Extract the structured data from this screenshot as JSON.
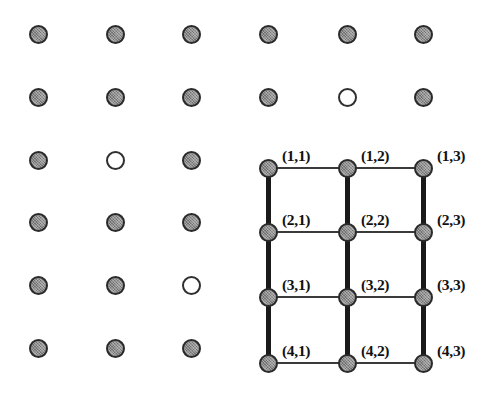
{
  "figure": {
    "width": 496,
    "height": 395,
    "background_color": "#ffffff",
    "site_colors": {
      "filled_fill": "#8e8e8e",
      "filled_border": "#2a2a2a",
      "empty_fill": "#ffffff",
      "empty_border": "#2f2f2f",
      "bond_vertical": "#1a1a1a",
      "bond_horizontal": "#3a3a3a",
      "label_color": "#111111"
    }
  },
  "lattice": {
    "columns": 6,
    "rows": 6,
    "column_x": [
      38,
      115,
      191,
      268,
      347,
      423
    ],
    "row_y": [
      34,
      97,
      160,
      222,
      285,
      348
    ],
    "site_diameter": 19,
    "sites": [
      {
        "row": 1,
        "col": 1,
        "state": "filled"
      },
      {
        "row": 1,
        "col": 2,
        "state": "filled"
      },
      {
        "row": 1,
        "col": 3,
        "state": "filled"
      },
      {
        "row": 1,
        "col": 4,
        "state": "filled"
      },
      {
        "row": 1,
        "col": 5,
        "state": "filled"
      },
      {
        "row": 1,
        "col": 6,
        "state": "filled"
      },
      {
        "row": 2,
        "col": 1,
        "state": "filled"
      },
      {
        "row": 2,
        "col": 2,
        "state": "filled"
      },
      {
        "row": 2,
        "col": 3,
        "state": "filled"
      },
      {
        "row": 2,
        "col": 4,
        "state": "filled"
      },
      {
        "row": 2,
        "col": 5,
        "state": "empty"
      },
      {
        "row": 2,
        "col": 6,
        "state": "filled"
      },
      {
        "row": 3,
        "col": 1,
        "state": "filled"
      },
      {
        "row": 3,
        "col": 2,
        "state": "empty"
      },
      {
        "row": 3,
        "col": 3,
        "state": "filled"
      },
      {
        "row": 3,
        "col": 4,
        "state": "filled"
      },
      {
        "row": 3,
        "col": 5,
        "state": "filled"
      },
      {
        "row": 3,
        "col": 6,
        "state": "filled"
      },
      {
        "row": 4,
        "col": 1,
        "state": "filled"
      },
      {
        "row": 4,
        "col": 2,
        "state": "filled"
      },
      {
        "row": 4,
        "col": 3,
        "state": "filled"
      },
      {
        "row": 4,
        "col": 4,
        "state": "filled"
      },
      {
        "row": 4,
        "col": 5,
        "state": "filled"
      },
      {
        "row": 4,
        "col": 6,
        "state": "filled"
      },
      {
        "row": 5,
        "col": 1,
        "state": "filled"
      },
      {
        "row": 5,
        "col": 2,
        "state": "filled"
      },
      {
        "row": 5,
        "col": 3,
        "state": "empty"
      },
      {
        "row": 5,
        "col": 4,
        "state": "filled"
      },
      {
        "row": 5,
        "col": 5,
        "state": "filled"
      },
      {
        "row": 5,
        "col": 6,
        "state": "filled"
      },
      {
        "row": 6,
        "col": 1,
        "state": "filled"
      },
      {
        "row": 6,
        "col": 2,
        "state": "filled"
      },
      {
        "row": 6,
        "col": 3,
        "state": "filled"
      },
      {
        "row": 6,
        "col": 4,
        "state": "filled"
      },
      {
        "row": 6,
        "col": 5,
        "state": "filled"
      },
      {
        "row": 6,
        "col": 6,
        "state": "filled"
      }
    ]
  },
  "labelled_block": {
    "description": "Bottom-right 4x3 block of sites connected by bonds and annotated with (row,column) index labels",
    "node_columns_x": [
      268,
      347,
      423
    ],
    "node_rows_y": [
      168,
      232,
      297,
      363
    ],
    "labels": [
      {
        "text": "(1,1)",
        "x": 282,
        "y": 148
      },
      {
        "text": "(1,2)",
        "x": 361,
        "y": 148
      },
      {
        "text": "(1,3)",
        "x": 437,
        "y": 148
      },
      {
        "text": "(2,1)",
        "x": 282,
        "y": 212
      },
      {
        "text": "(2,2)",
        "x": 361,
        "y": 212
      },
      {
        "text": "(2,3)",
        "x": 437,
        "y": 212
      },
      {
        "text": "(3,1)",
        "x": 282,
        "y": 277
      },
      {
        "text": "(3,2)",
        "x": 361,
        "y": 277
      },
      {
        "text": "(3,3)",
        "x": 437,
        "y": 277
      },
      {
        "text": "(4,1)",
        "x": 282,
        "y": 343
      },
      {
        "text": "(4,2)",
        "x": 361,
        "y": 343
      },
      {
        "text": "(4,3)",
        "x": 437,
        "y": 343
      }
    ],
    "vertical_bonds": [
      {
        "x": 268,
        "y1": 168,
        "y2": 232
      },
      {
        "x": 268,
        "y1": 232,
        "y2": 297
      },
      {
        "x": 268,
        "y1": 297,
        "y2": 363
      },
      {
        "x": 347,
        "y1": 168,
        "y2": 232
      },
      {
        "x": 347,
        "y1": 232,
        "y2": 297
      },
      {
        "x": 347,
        "y1": 297,
        "y2": 363
      },
      {
        "x": 423,
        "y1": 168,
        "y2": 232
      },
      {
        "x": 423,
        "y1": 232,
        "y2": 297
      },
      {
        "x": 423,
        "y1": 297,
        "y2": 363
      }
    ],
    "horizontal_bonds": [
      {
        "y": 168,
        "x1": 268,
        "x2": 347
      },
      {
        "y": 168,
        "x1": 347,
        "x2": 423
      },
      {
        "y": 232,
        "x1": 268,
        "x2": 347
      },
      {
        "y": 232,
        "x1": 347,
        "x2": 423
      },
      {
        "y": 297,
        "x1": 268,
        "x2": 347
      },
      {
        "y": 297,
        "x1": 347,
        "x2": 423
      },
      {
        "y": 363,
        "x1": 268,
        "x2": 347
      },
      {
        "y": 363,
        "x1": 347,
        "x2": 423
      }
    ]
  }
}
